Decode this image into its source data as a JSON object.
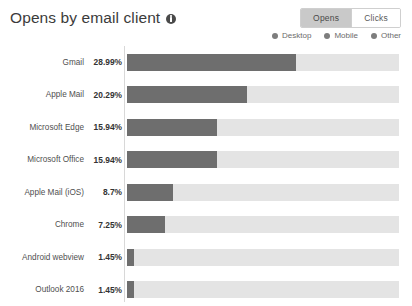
{
  "header": {
    "title": "Opens by email client",
    "info_icon": "info-icon"
  },
  "toggle": {
    "options": [
      {
        "label": "Opens",
        "active": true
      },
      {
        "label": "Clicks",
        "active": false
      }
    ]
  },
  "legend": {
    "items": [
      {
        "label": "Desktop",
        "color": "#7d7d7d"
      },
      {
        "label": "Mobile",
        "color": "#7d7d7d"
      },
      {
        "label": "Other",
        "color": "#7d7d7d"
      }
    ]
  },
  "colors": {
    "desktop": "#6e6e6e",
    "mobile": "#e4e4e4",
    "other": "#e8e8e8",
    "track": "#e8e8e8",
    "axis": "#d8d8d8",
    "toggle_active_bg": "#c9c9c9"
  },
  "chart_data": {
    "type": "bar",
    "title": "Opens by email client",
    "xlabel": "",
    "ylabel": "",
    "orientation": "horizontal",
    "stacked": true,
    "grid": false,
    "legend_position": "top-right",
    "legend": [
      "Desktop",
      "Mobile",
      "Other"
    ],
    "categories": [
      "Gmail",
      "Apple Mail",
      "Microsoft Edge",
      "Microsoft Office",
      "Apple Mail (iOS)",
      "Chrome",
      "Android webview",
      "Outlook 2016"
    ],
    "value_labels": [
      "28.99%",
      "20.29%",
      "15.94%",
      "15.94%",
      "8.7%",
      "7.25%",
      "1.45%",
      "1.45%"
    ],
    "values": [
      28.99,
      20.29,
      15.94,
      15.94,
      8.7,
      7.25,
      1.45,
      1.45
    ],
    "xlim": [
      0,
      46.8
    ],
    "bar_fill_percent": [
      62,
      44,
      33,
      33,
      17,
      14,
      2.5,
      2.5
    ],
    "rows": [
      {
        "category": "Gmail",
        "value_label": "28.99%",
        "value": 28.99,
        "fill": 62
      },
      {
        "category": "Apple Mail",
        "value_label": "20.29%",
        "value": 20.29,
        "fill": 44
      },
      {
        "category": "Microsoft Edge",
        "value_label": "15.94%",
        "value": 15.94,
        "fill": 33
      },
      {
        "category": "Microsoft Office",
        "value_label": "15.94%",
        "value": 15.94,
        "fill": 33
      },
      {
        "category": "Apple Mail (iOS)",
        "value_label": "8.7%",
        "value": 8.7,
        "fill": 17
      },
      {
        "category": "Chrome",
        "value_label": "7.25%",
        "value": 7.25,
        "fill": 14
      },
      {
        "category": "Android webview",
        "value_label": "1.45%",
        "value": 1.45,
        "fill": 2.5
      },
      {
        "category": "Outlook 2016",
        "value_label": "1.45%",
        "value": 1.45,
        "fill": 2.5
      }
    ]
  }
}
